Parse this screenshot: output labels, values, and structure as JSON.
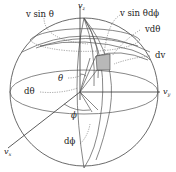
{
  "figure": {
    "axes": {
      "z": {
        "symbol": "v",
        "sub": "z"
      },
      "y": {
        "symbol": "v",
        "sub": "y"
      },
      "x": {
        "symbol": "v",
        "sub": "x"
      }
    },
    "labels": {
      "v_sin_theta": "v sin θ",
      "v_sin_theta_dphi": "v sin θdϕ",
      "v_dtheta": "vdθ",
      "dv": "dv",
      "theta": "θ",
      "dtheta": "dθ",
      "phi": "ϕ",
      "dphi": "dϕ"
    },
    "colors": {
      "line": "#555555",
      "shaded_element": "#b8b8b8",
      "background": "#ffffff"
    }
  }
}
